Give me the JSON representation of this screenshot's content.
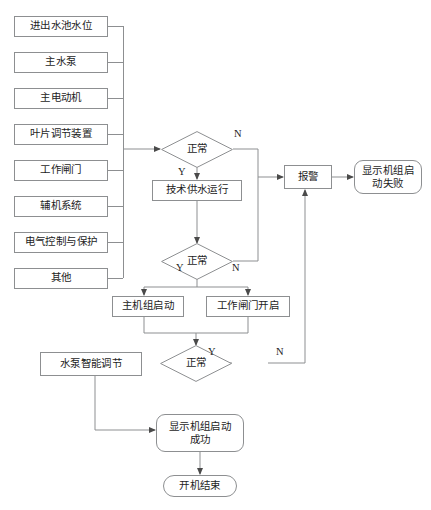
{
  "diagram": {
    "colors": {
      "line": "#8d8f91",
      "text": "#1d1d1d",
      "background": "#ffffff"
    }
  },
  "condition_inputs": [
    {
      "id": "inlet-outlet-pool-level",
      "label": "进出水池水位"
    },
    {
      "id": "main-water-pump",
      "label": "主水泵"
    },
    {
      "id": "main-motor",
      "label": "主电动机"
    },
    {
      "id": "blade-adjust-device",
      "label": "叶片调节装置"
    },
    {
      "id": "working-gate",
      "label": "工作闸门"
    },
    {
      "id": "auxiliary-system",
      "label": "辅机系统"
    },
    {
      "id": "electrical-control-protection",
      "label": "电气控制与保护"
    },
    {
      "id": "other",
      "label": "其他"
    }
  ],
  "decisions": {
    "first": {
      "label": "正常",
      "yes": "Y",
      "no": "N"
    },
    "second": {
      "label": "正常",
      "yes": "Y",
      "no": "N"
    },
    "third": {
      "label": "正常",
      "yes": "Y",
      "no": "N"
    }
  },
  "processes": {
    "tech_water_supply": "技术供水运行",
    "main_unit_start": "主机组启动",
    "working_gate_open": "工作闸门开启",
    "pump_smart_adjust": "水泵智能调节",
    "alarm": "报警"
  },
  "terminals": {
    "start_fail": "显示机组启动失败",
    "start_fail_line1": "显示机组启",
    "start_fail_line2": "动失败",
    "start_success": "显示机组启动成功",
    "start_success_line1": "显示机组启动",
    "start_success_line2": "成功",
    "startup_end": "开机结束"
  }
}
